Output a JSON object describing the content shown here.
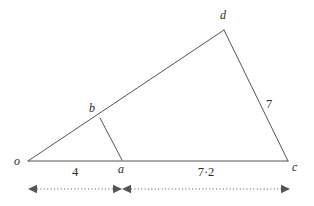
{
  "figure": {
    "type": "geometry-diagram",
    "background_color": "#ffffff",
    "stroke_color": "#555555",
    "label_color": "#2b2b2b",
    "stroke_width": 1,
    "width": 314,
    "height": 206,
    "vertices": [
      {
        "id": "o",
        "label": "o",
        "x": 28,
        "y": 161,
        "label_x": 14,
        "label_y": 155
      },
      {
        "id": "a",
        "label": "a",
        "x": 122,
        "y": 160,
        "label_x": 118,
        "label_y": 163
      },
      {
        "id": "b",
        "label": "b",
        "x": 100,
        "y": 118,
        "label_x": 89,
        "label_y": 102
      },
      {
        "id": "c",
        "label": "c",
        "x": 288,
        "y": 161,
        "label_x": 292,
        "label_y": 161
      },
      {
        "id": "d",
        "label": "d",
        "x": 224,
        "y": 30,
        "label_x": 220,
        "label_y": 9
      }
    ],
    "segments": [
      {
        "id": "od",
        "from": "o",
        "to": "d"
      },
      {
        "id": "dc",
        "from": "d",
        "to": "c"
      },
      {
        "id": "oc",
        "from": "o",
        "to": "c"
      },
      {
        "id": "ba",
        "from": "b",
        "to": "a"
      }
    ],
    "side_labels": [
      {
        "id": "dc-length",
        "text": "7",
        "x": 266,
        "y": 98
      }
    ],
    "dimensions": {
      "line_y": 189,
      "tick_color": "#555555",
      "spans": [
        {
          "id": "oa-span",
          "text": "4",
          "start_x": 28,
          "end_x": 122,
          "label_x": 75,
          "label_y": 166
        },
        {
          "id": "ac-span",
          "text": "7·2",
          "start_x": 122,
          "end_x": 290,
          "label_x": 206,
          "label_y": 166
        }
      ]
    }
  }
}
